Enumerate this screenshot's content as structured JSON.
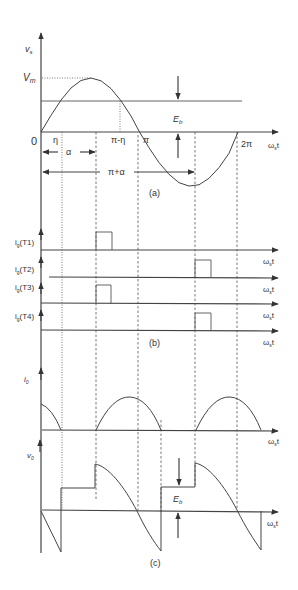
{
  "figure": {
    "panel_a": {
      "caption": "(a)",
      "y_label": "v",
      "y_label_sub": "s",
      "x_label": "ω",
      "x_label_sub": "s",
      "x_label_t": "t",
      "peak_label": "V",
      "peak_label_sub": "m",
      "origin_label": "0",
      "eb_label": "E",
      "eb_label_sub": "b",
      "ticks": {
        "eta": "η",
        "pi_minus_eta": "π-η",
        "pi": "π",
        "two_pi": "2π"
      },
      "interval_alpha": "α",
      "interval_pi_plus_alpha": "π+α"
    },
    "panel_b": {
      "caption": "(b)",
      "gates": [
        {
          "label": "i",
          "sub": "g",
          "name": "(T1)"
        },
        {
          "label": "i",
          "sub": "g",
          "name": "(T2)"
        },
        {
          "label": "i",
          "sub": "g",
          "name": "(T3)"
        },
        {
          "label": "i",
          "sub": "g",
          "name": "(T4)"
        }
      ],
      "x_label": "ω",
      "x_label_sub": "s",
      "x_label_t": "t"
    },
    "panel_c": {
      "caption": "(c)",
      "current_label": "i",
      "current_label_sub": "0",
      "voltage_label": "v",
      "voltage_label_sub": "0",
      "eb_label": "E",
      "eb_label_sub": "b",
      "x_label": "ω",
      "x_label_sub": "s",
      "x_label_t": "t"
    }
  }
}
